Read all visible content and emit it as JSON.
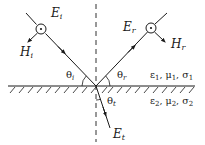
{
  "diagram": {
    "colors": {
      "stroke": "#1a1a1a",
      "background": "#ffffff"
    },
    "interface": {
      "y": 86,
      "x1": 8,
      "x2": 195
    },
    "normal": {
      "x": 96,
      "y1": 4,
      "y2": 142,
      "style": "dashed"
    },
    "rays": {
      "incident": {
        "symbol": "E",
        "sub": "i",
        "from": [
          26,
          13
        ],
        "to": [
          96,
          86
        ]
      },
      "reflected": {
        "symbol": "E",
        "sub": "r",
        "from": [
          96,
          86
        ],
        "to": [
          167,
          13
        ]
      },
      "transmitted": {
        "symbol": "E",
        "sub": "t",
        "from": [
          96,
          86
        ],
        "to": [
          110,
          128
        ]
      }
    },
    "h_fields": {
      "incident": {
        "symbol": "H",
        "sub": "i"
      },
      "reflected": {
        "symbol": "H",
        "sub": "r"
      }
    },
    "angles": {
      "incident": {
        "symbol": "θ",
        "sub": "i"
      },
      "reflected": {
        "symbol": "θ",
        "sub": "r"
      },
      "transmitted": {
        "symbol": "θ",
        "sub": "t"
      }
    },
    "media": {
      "upper": {
        "eps": "ε",
        "eps_sub": "1",
        "mu": "μ",
        "mu_sub": "1",
        "sigma": "σ",
        "sigma_sub": "1",
        "sep": ", "
      },
      "lower": {
        "eps": "ε",
        "eps_sub": "2",
        "mu": "μ",
        "mu_sub": "2",
        "sigma": "σ",
        "sigma_sub": "2",
        "sep": ", "
      }
    }
  }
}
